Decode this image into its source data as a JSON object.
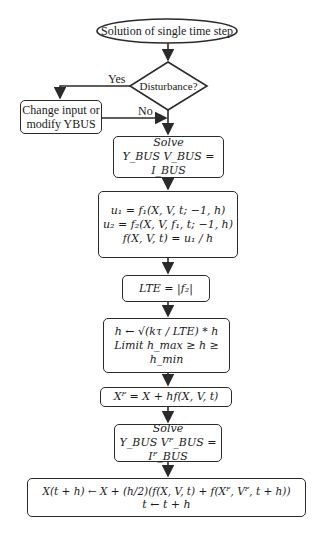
{
  "flowchart": {
    "start": {
      "label": "Solution of single time step"
    },
    "decision": {
      "label": "Disturbance?",
      "yes_label": "Yes",
      "no_label": "No"
    },
    "change_box": {
      "line1": "Change input or",
      "line2": "modify YBUS"
    },
    "solve1": {
      "line1": "Solve",
      "line2": "Y_BUS V_BUS = I_BUS"
    },
    "u_box": {
      "line1": "u₁ = f₁(X, V, t; −1, h)",
      "line2": "u₂ = f₂(X, V, f₁, t; −1, h)",
      "line3": "f(X, V, t) = u₁ / h"
    },
    "lte_box": {
      "line1": "LTE = |f₂|"
    },
    "h_box": {
      "line1": "h ← √(kτ / LTE) * h",
      "line2": "Limit h_max ≥ h ≥ h_min"
    },
    "xp_box": {
      "line1": "Xᴾ = X + hf(X, V, t)"
    },
    "solve2": {
      "line1": "Solve",
      "line2": "Y_BUS Vᴾ_BUS = Iᴾ_BUS"
    },
    "final_box": {
      "line1": "X(t + h) ← X + (h/2)(f(X, V, t) + f(Xᴾ, Vᴾ, t + h))",
      "line2": "t ← t + h"
    }
  }
}
